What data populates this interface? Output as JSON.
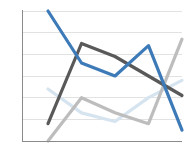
{
  "chart_data": {
    "type": "line",
    "title": "",
    "subtitle": "",
    "xlabel": "",
    "ylabel": "",
    "grid": true,
    "legend": "none",
    "x": [
      1,
      2,
      3,
      4,
      5
    ],
    "xlim": [
      1,
      5
    ],
    "ylim": [
      0,
      6
    ],
    "yticks": [
      0,
      1,
      2,
      3,
      4,
      5,
      6
    ],
    "ytick_labels": [
      "",
      "",
      "",
      "",
      "",
      "",
      ""
    ],
    "xtick_labels": [
      "",
      "",
      "",
      "",
      ""
    ],
    "series": [
      {
        "name": "series-blue",
        "color": "#3d7ab8",
        "width": 3.2,
        "values": [
          6.0,
          3.6,
          3.0,
          4.4,
          0.5
        ]
      },
      {
        "name": "series-dark-gray",
        "color": "#595959",
        "width": 3.2,
        "values": [
          0.8,
          4.5,
          3.9,
          3.0,
          2.1
        ]
      },
      {
        "name": "series-light-gray",
        "color": "#bdbdbd",
        "width": 3.2,
        "values": [
          0.0,
          2.0,
          1.3,
          0.8,
          4.7
        ]
      },
      {
        "name": "series-pale-blue",
        "color": "#d6e4f0",
        "width": 3.2,
        "values": [
          2.4,
          1.3,
          0.9,
          2.0,
          2.8
        ]
      }
    ]
  },
  "axes": {
    "plot_left": 22,
    "plot_right": 182,
    "plot_top": 11,
    "plot_bottom": 141,
    "x_first": 48,
    "x_last": 182,
    "y_top_value": 6,
    "y_bottom_value": 0,
    "gridline_count": 6
  },
  "icons": {
    "chart_type_icon": "line-chart-icon"
  }
}
